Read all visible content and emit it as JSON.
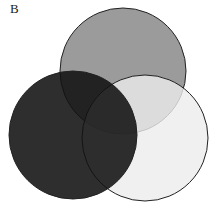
{
  "panel_label": "B",
  "diagram": {
    "type": "venn",
    "sets": [
      {
        "name": "top-circle",
        "cx": 123,
        "cy": 71,
        "r": 63,
        "fill": "#8a8a8a",
        "opacity": 0.85
      },
      {
        "name": "right-circle",
        "cx": 145,
        "cy": 138,
        "r": 63,
        "fill": "#e6e6e6",
        "opacity": 0.8
      },
      {
        "name": "left-circle",
        "cx": 73,
        "cy": 135,
        "r": 64,
        "fill": "#111111",
        "opacity": 0.88
      }
    ],
    "stroke": "#222222"
  }
}
